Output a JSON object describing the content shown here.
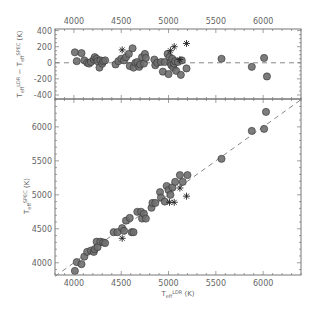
{
  "chart_data": [
    {
      "panel": "top",
      "type": "scatter",
      "xlabel": "",
      "ylabel": "T_eff^LDR − T_eff^SPEC (K)",
      "xlim": [
        3800,
        6400
      ],
      "ylim": [
        -450,
        420
      ],
      "x_ticks": [
        4000,
        4500,
        5000,
        5500,
        6000
      ],
      "x_ticks_position": "top",
      "y_ticks": [
        -400,
        -200,
        0,
        200,
        400
      ],
      "reference_line": {
        "y": 0,
        "style": "dashed"
      },
      "series": [
        {
          "name": "stars (circles)",
          "marker": "filled-circle",
          "points": [
            [
              4010,
              130
            ],
            [
              4030,
              20
            ],
            [
              4080,
              120
            ],
            [
              4110,
              30
            ],
            [
              4140,
              0
            ],
            [
              4160,
              -10
            ],
            [
              4180,
              10
            ],
            [
              4210,
              40
            ],
            [
              4220,
              70
            ],
            [
              4240,
              50
            ],
            [
              4250,
              20
            ],
            [
              4270,
              -60
            ],
            [
              4280,
              30
            ],
            [
              4300,
              -10
            ],
            [
              4310,
              20
            ],
            [
              4330,
              30
            ],
            [
              4440,
              -20
            ],
            [
              4470,
              20
            ],
            [
              4500,
              50
            ],
            [
              4530,
              30
            ],
            [
              4550,
              70
            ],
            [
              4580,
              110
            ],
            [
              4590,
              -40
            ],
            [
              4620,
              180
            ],
            [
              4630,
              -60
            ],
            [
              4650,
              0
            ],
            [
              4670,
              10
            ],
            [
              4690,
              -50
            ],
            [
              4700,
              -20
            ],
            [
              4720,
              70
            ],
            [
              4740,
              -10
            ],
            [
              4750,
              110
            ],
            [
              4760,
              60
            ],
            [
              4850,
              40
            ],
            [
              4860,
              -30
            ],
            [
              4880,
              0
            ],
            [
              4920,
              10
            ],
            [
              4940,
              -110
            ],
            [
              4960,
              10
            ],
            [
              4990,
              110
            ],
            [
              5000,
              -140
            ],
            [
              5010,
              70
            ],
            [
              5020,
              0
            ],
            [
              5030,
              -30
            ],
            [
              5040,
              50
            ],
            [
              5050,
              -60
            ],
            [
              5060,
              -10
            ],
            [
              5070,
              20
            ],
            [
              5080,
              -100
            ],
            [
              5100,
              10
            ],
            [
              5130,
              -150
            ],
            [
              5140,
              30
            ],
            [
              5190,
              -70
            ],
            [
              5560,
              50
            ],
            [
              5880,
              -50
            ],
            [
              6010,
              60
            ],
            [
              6040,
              -170
            ]
          ]
        },
        {
          "name": "stars (asterisks)",
          "marker": "asterisk",
          "points": [
            [
              4510,
              160
            ],
            [
              5020,
              150
            ],
            [
              5060,
              200
            ],
            [
              5120,
              40
            ],
            [
              5190,
              240
            ]
          ]
        }
      ]
    },
    {
      "panel": "bottom",
      "type": "scatter",
      "xlabel": "T_eff^LDR (K)",
      "ylabel": "T_eff^SPEC (K)",
      "xlim": [
        3800,
        6400
      ],
      "ylim": [
        3820,
        6410
      ],
      "x_ticks": [
        4000,
        4500,
        5000,
        5500,
        6000
      ],
      "y_ticks": [
        4000,
        4500,
        5000,
        5500,
        6000
      ],
      "reference_line": {
        "type": "one-to-one",
        "style": "dashed"
      },
      "series": [
        {
          "name": "stars (circles)",
          "marker": "filled-circle",
          "points": [
            [
              4010,
              3880
            ],
            [
              4030,
              4010
            ],
            [
              4080,
              3980
            ],
            [
              4110,
              4090
            ],
            [
              4140,
              4160
            ],
            [
              4180,
              4180
            ],
            [
              4210,
              4160
            ],
            [
              4220,
              4200
            ],
            [
              4240,
              4310
            ],
            [
              4250,
              4230
            ],
            [
              4280,
              4310
            ],
            [
              4310,
              4300
            ],
            [
              4330,
              4290
            ],
            [
              4420,
              4450
            ],
            [
              4460,
              4450
            ],
            [
              4510,
              4510
            ],
            [
              4530,
              4470
            ],
            [
              4550,
              4620
            ],
            [
              4590,
              4660
            ],
            [
              4610,
              4450
            ],
            [
              4630,
              4450
            ],
            [
              4670,
              4750
            ],
            [
              4710,
              4750
            ],
            [
              4720,
              4650
            ],
            [
              4740,
              4720
            ],
            [
              4760,
              4650
            ],
            [
              4820,
              4810
            ],
            [
              4830,
              4880
            ],
            [
              4860,
              4880
            ],
            [
              4910,
              5040
            ],
            [
              4920,
              4960
            ],
            [
              4960,
              4900
            ],
            [
              4980,
              5130
            ],
            [
              5000,
              5070
            ],
            [
              5020,
              5000
            ],
            [
              5040,
              5110
            ],
            [
              5070,
              5190
            ],
            [
              5120,
              5290
            ],
            [
              5150,
              5190
            ],
            [
              5200,
              5290
            ],
            [
              5560,
              5530
            ],
            [
              5880,
              5940
            ],
            [
              6010,
              5970
            ],
            [
              6030,
              6220
            ]
          ]
        },
        {
          "name": "stars (asterisks)",
          "marker": "asterisk",
          "points": [
            [
              4510,
              4360
            ],
            [
              5010,
              4890
            ],
            [
              5060,
              4890
            ],
            [
              5120,
              5100
            ],
            [
              5190,
              4980
            ]
          ]
        }
      ]
    }
  ],
  "labels": {
    "top_ylabel_main": "T",
    "top_ylabel_sub1": "eff",
    "top_ylabel_sup1": "LDR",
    "top_ylabel_mid": " − T",
    "top_ylabel_sub2": "eff",
    "top_ylabel_sup2": "SPEC",
    "top_ylabel_unit": " (K)",
    "bottom_ylabel_main": "T",
    "bottom_ylabel_sub": "eff",
    "bottom_ylabel_sup": "SPEC",
    "bottom_ylabel_unit": " (K)",
    "xlabel_main": "T",
    "xlabel_sub": "eff",
    "xlabel_sup": "LDR",
    "xlabel_unit": " (K)"
  },
  "colors": {
    "marker_fill": "#6e6e6e",
    "marker_stroke": "#333333",
    "axis": "#777777",
    "dashed_line": "#888888",
    "text": "#666666"
  }
}
